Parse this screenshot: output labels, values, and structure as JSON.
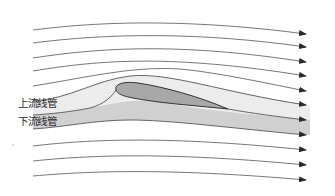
{
  "diagram": {
    "labels": {
      "upper_tube": "上流线管",
      "lower_tube": "下流线管"
    },
    "colors": {
      "background": "#ffffff",
      "streamline": "#555555",
      "upper_tube_fill": "#ececec",
      "lower_tube_fill": "#cfcfcf",
      "airfoil_fill": "#a9a9a9",
      "airfoil_stroke": "#333333",
      "arrow": "#2a2a2a"
    },
    "streamlines_above": 5,
    "stream_tubes": 2,
    "streamlines_below": 3,
    "flow_direction": "left-to-right"
  }
}
